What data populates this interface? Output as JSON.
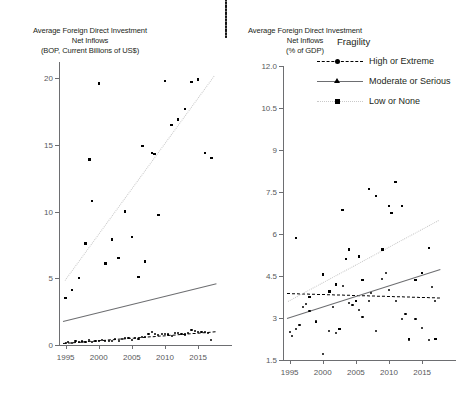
{
  "page": {
    "width": 454,
    "height": 406,
    "background": "#ffffff",
    "cut_off_title_remnant": ""
  },
  "colors": {
    "text": "#231f20",
    "tick_label": "#58595b",
    "axis": "#6d6e71",
    "marker": "#000000",
    "trend_high_or_extreme": "#000000",
    "trend_moderate_or_serious": "#6d6e71",
    "trend_low_or_none": "#c9c9c9"
  },
  "legend": {
    "title": "Fragility",
    "position": "top-right of right panel",
    "entries": [
      {
        "label": "High or Extreme",
        "marker": "circle",
        "line": "dashed",
        "color": "#000000"
      },
      {
        "label": "Moderate or Serious",
        "marker": "triangle",
        "line": "solid",
        "color": "#000000"
      },
      {
        "label": "Low or None",
        "marker": "square",
        "line": "dotted",
        "color": "#c9c9c9"
      }
    ]
  },
  "chart_data": [
    {
      "id": "left",
      "type": "scatter",
      "title": "Average Foreign Direct Investment\nNet Inflows\n(BOP, Current Billions of US$)",
      "title_lines": [
        "Average Foreign Direct Investment",
        "Net Inflows",
        "(BOP, Current Billions of US$)"
      ],
      "xlabel": "",
      "ylabel": "Average Foreign Direct Investment Net Inflows (BOP, Current Billions of US$)",
      "xlim": [
        1994,
        2018
      ],
      "ylim": [
        0,
        21.2
      ],
      "xticks": [
        1995,
        2000,
        2005,
        2010,
        2015
      ],
      "yticks": [
        0,
        5,
        10,
        15,
        20
      ],
      "ytick_labels": [
        "0",
        "5",
        "10",
        "15",
        "20"
      ],
      "xtick_labels": [
        "1995",
        "2000",
        "2005",
        "2010",
        "2015"
      ],
      "grid": false,
      "legend_shown": false,
      "series": [
        {
          "name": "High or Extreme",
          "marker": "circle",
          "trend": "dashed",
          "trend_color": "#000000",
          "trend_endpoints": [
            [
              1994.6,
              0.18
            ],
            [
              2017.6,
              1.05
            ]
          ],
          "points": [
            [
              1995,
              0.18
            ],
            [
              1996,
              0.12
            ],
            [
              1997,
              0.22
            ],
            [
              1998,
              0.25
            ],
            [
              1999,
              0.2
            ],
            [
              2000,
              0.3
            ],
            [
              2001,
              0.28
            ],
            [
              2002,
              0.33
            ],
            [
              2003,
              0.3
            ],
            [
              2004,
              0.52
            ],
            [
              2005,
              0.4
            ],
            [
              2006,
              0.45
            ],
            [
              2007,
              0.62
            ],
            [
              2008,
              0.95
            ],
            [
              2009,
              0.72
            ],
            [
              2010,
              0.85
            ],
            [
              2011,
              0.7
            ],
            [
              2012,
              0.9
            ],
            [
              2013,
              0.78
            ],
            [
              2014,
              1.15
            ],
            [
              2015,
              0.95
            ],
            [
              2016,
              1.0
            ],
            [
              2017,
              0.35
            ],
            [
              1995.4,
              0.22
            ],
            [
              1996.5,
              0.3
            ],
            [
              1997.5,
              0.26
            ],
            [
              1998.5,
              0.35
            ],
            [
              1999.5,
              0.32
            ],
            [
              2000.5,
              0.36
            ],
            [
              2001.5,
              0.31
            ],
            [
              2002.5,
              0.42
            ],
            [
              2003.5,
              0.45
            ],
            [
              2004.5,
              0.5
            ],
            [
              2005.5,
              0.55
            ],
            [
              2006.5,
              0.6
            ],
            [
              2007.5,
              0.85
            ],
            [
              2008.5,
              0.8
            ],
            [
              2009.5,
              0.82
            ],
            [
              2010.5,
              0.78
            ],
            [
              2011.5,
              0.88
            ],
            [
              2012.5,
              0.82
            ],
            [
              2013.5,
              0.92
            ],
            [
              2014.5,
              1.05
            ],
            [
              2015.5,
              0.98
            ],
            [
              2016.5,
              0.9
            ]
          ]
        },
        {
          "name": "Moderate or Serious",
          "marker": "triangle",
          "trend": "solid",
          "trend_color": "#6d6e71",
          "trend_endpoints": [
            [
              1994.6,
              1.78
            ],
            [
              2017.7,
              4.6
            ]
          ],
          "points": [
            [
              1995,
              1.35
            ],
            [
              1996,
              1.55
            ],
            [
              1997,
              1.45
            ],
            [
              1998,
              1.6
            ],
            [
              1999,
              1.5
            ],
            [
              2000,
              1.62
            ],
            [
              2001,
              1.58
            ],
            [
              2002,
              1.65
            ],
            [
              2003,
              1.62
            ],
            [
              2004,
              2.25
            ],
            [
              2005,
              3.5
            ],
            [
              2006,
              1.7
            ],
            [
              2007,
              1.75
            ],
            [
              2009,
              6.6
            ],
            [
              2010,
              5.3
            ],
            [
              2011,
              3.25
            ],
            [
              2012,
              3.05
            ],
            [
              2013,
              3.2
            ],
            [
              2014,
              3.1
            ],
            [
              2015,
              2.95
            ],
            [
              2016,
              3.3
            ],
            [
              2017,
              3.35
            ],
            [
              2013.5,
              3.0
            ],
            [
              2011.5,
              3.0
            ],
            [
              1999.5,
              1.55
            ],
            [
              2002.5,
              1.6
            ]
          ]
        },
        {
          "name": "Low or None",
          "marker": "square",
          "trend": "dotted",
          "trend_color": "#c9c9c9",
          "trend_endpoints": [
            [
              1994.9,
              4.9
            ],
            [
              2017.4,
              20.2
            ]
          ],
          "points": [
            [
              1995,
              3.5
            ],
            [
              1996,
              4.1
            ],
            [
              1997,
              5.0
            ],
            [
              1998,
              7.6
            ],
            [
              1999,
              10.8
            ],
            [
              2000,
              19.6
            ],
            [
              2001,
              6.1
            ],
            [
              2002,
              7.9
            ],
            [
              2003,
              6.5
            ],
            [
              2004,
              10.0
            ],
            [
              2005,
              8.1
            ],
            [
              2006,
              5.1
            ],
            [
              2007,
              6.25
            ],
            [
              2008,
              14.4
            ],
            [
              2009,
              9.75
            ],
            [
              2010,
              19.8
            ],
            [
              2011,
              16.5
            ],
            [
              2012,
              16.9
            ],
            [
              2013,
              17.7
            ],
            [
              2014,
              19.7
            ],
            [
              2015,
              19.9
            ],
            [
              2016,
              14.4
            ],
            [
              2017,
              14.0
            ],
            [
              2006.6,
              14.9
            ],
            [
              2008.4,
              14.3
            ],
            [
              1998.6,
              13.9
            ]
          ]
        }
      ]
    },
    {
      "id": "right",
      "type": "scatter",
      "title": "Average Foreign Direct Investment\nNet Inflows\n(% of GDP)",
      "title_lines": [
        "Average Foreign Direct Investment",
        "Net Inflows",
        "(% of GDP)"
      ],
      "xlabel": "",
      "ylabel": "Average Foreign Direct Investment Net Inflows (% of GDP)",
      "xlim": [
        1994,
        2018
      ],
      "ylim": [
        1.5,
        12.0
      ],
      "xticks": [
        1995,
        2000,
        2005,
        2010,
        2015
      ],
      "yticks": [
        1.5,
        3,
        4.5,
        6,
        7.5,
        9,
        10.5,
        12.0
      ],
      "ytick_labels": [
        "1.5",
        "3",
        "4.5",
        "6",
        "7.5",
        "9",
        "10.5",
        "12.0"
      ],
      "xtick_labels": [
        "1995",
        "2000",
        "2005",
        "2010",
        "2015"
      ],
      "grid": false,
      "legend_shown": true,
      "series": [
        {
          "name": "High or Extreme",
          "marker": "circle",
          "trend": "dashed",
          "trend_color": "#000000",
          "trend_endpoints": [
            [
              1994.6,
              3.88
            ],
            [
              2017.7,
              3.72
            ]
          ],
          "points": [
            [
              1995,
              2.5
            ],
            [
              1995.3,
              2.35
            ],
            [
              1996,
              2.6
            ],
            [
              1997,
              3.4
            ],
            [
              1998,
              3.25
            ],
            [
              1999,
              2.9
            ],
            [
              2000,
              1.7
            ],
            [
              2001,
              2.55
            ],
            [
              2002,
              2.45
            ],
            [
              2003,
              4.15
            ],
            [
              2004,
              3.55
            ],
            [
              2005,
              3.6
            ],
            [
              2006,
              3.05
            ],
            [
              2007,
              3.6
            ],
            [
              2008,
              2.55
            ],
            [
              2009,
              4.4
            ],
            [
              2010,
              4.0
            ],
            [
              2011,
              3.6
            ],
            [
              2012,
              2.95
            ],
            [
              2013,
              2.2
            ],
            [
              2014,
              2.95
            ],
            [
              2015,
              2.65
            ],
            [
              2016,
              2.2
            ],
            [
              1996.5,
              2.75
            ],
            [
              1997.5,
              3.5
            ],
            [
              2001.5,
              3.4
            ],
            [
              2004.5,
              3.45
            ],
            [
              2005.5,
              3.3
            ],
            [
              2007.3,
              3.9
            ],
            [
              2009.5,
              4.6
            ],
            [
              2012.5,
              3.15
            ],
            [
              2016.5,
              4.1
            ],
            [
              2017,
              3.6
            ]
          ]
        },
        {
          "name": "Moderate or Serious",
          "marker": "triangle",
          "trend": "solid",
          "trend_color": "#6d6e71",
          "trend_endpoints": [
            [
              1994.6,
              3.0
            ],
            [
              2017.7,
              4.75
            ]
          ],
          "points": [
            [
              1995,
              3.05
            ],
            [
              1996,
              3.2
            ],
            [
              1997,
              4.75
            ],
            [
              1998,
              3.3
            ],
            [
              1999,
              2.95
            ],
            [
              2000,
              3.55
            ],
            [
              2001,
              3.85
            ],
            [
              2002,
              4.0
            ],
            [
              2003,
              5.05
            ],
            [
              2004,
              3.5
            ],
            [
              2005,
              4.3
            ],
            [
              2006,
              3.7
            ],
            [
              2007,
              5.3
            ],
            [
              2008,
              4.25
            ],
            [
              2009,
              5.05
            ],
            [
              2010,
              4.45
            ],
            [
              2011,
              4.7
            ],
            [
              2012,
              3.9
            ],
            [
              2013,
              4.3
            ],
            [
              2014,
              4.55
            ],
            [
              2015,
              3.9
            ],
            [
              2016,
              3.55
            ],
            [
              2017,
              3.6
            ],
            [
              2006.5,
              3.85
            ],
            [
              2008.5,
              4.4
            ],
            [
              2010.5,
              4.0
            ],
            [
              2013.5,
              4.2
            ]
          ]
        },
        {
          "name": "Low or None",
          "marker": "square",
          "trend": "dotted",
          "trend_color": "#c9c9c9",
          "trend_endpoints": [
            [
              1994.8,
              3.6
            ],
            [
              2017.6,
              6.5
            ]
          ],
          "points": [
            [
              1996,
              5.85
            ],
            [
              1998,
              3.75
            ],
            [
              2000,
              4.55
            ],
            [
              2001,
              3.95
            ],
            [
              2002,
              4.2
            ],
            [
              2003,
              6.85
            ],
            [
              2004,
              5.45
            ],
            [
              2005,
              3.6
            ],
            [
              2006,
              4.35
            ],
            [
              2007,
              7.6
            ],
            [
              2008,
              7.35
            ],
            [
              2009,
              5.45
            ],
            [
              2010,
              7.0
            ],
            [
              2010.4,
              6.75
            ],
            [
              2011,
              7.85
            ],
            [
              2012,
              7.0
            ],
            [
              2014,
              4.35
            ],
            [
              2015,
              4.6
            ],
            [
              2016,
              5.5
            ],
            [
              2017,
              2.25
            ],
            [
              1999,
              2.85
            ],
            [
              2002.5,
              2.6
            ],
            [
              2013,
              2.25
            ],
            [
              2005.5,
              5.2
            ],
            [
              2003.5,
              5.1
            ]
          ]
        }
      ]
    }
  ]
}
